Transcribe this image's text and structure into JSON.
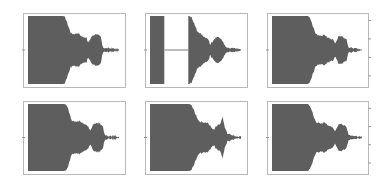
{
  "chart_data": [
    {
      "type": "area",
      "title": "",
      "xlabel": "",
      "ylabel": "",
      "xlim": [
        0,
        1
      ],
      "ylim": [
        -1,
        1
      ],
      "grid": false,
      "envelope": {
        "x": [
          0,
          0.39,
          0.41,
          0.47,
          0.5,
          0.55,
          0.6,
          0.64,
          0.66,
          0.7,
          0.75,
          0.8,
          0.82,
          0.86,
          0.92,
          1.0
        ],
        "amp": [
          1,
          1,
          0.95,
          0.5,
          0.47,
          0.5,
          0.38,
          0.38,
          0.2,
          0.4,
          0.48,
          0.38,
          0.08,
          0.05,
          0.05,
          0.02
        ]
      },
      "silent_gap": null
    },
    {
      "type": "area",
      "title": "",
      "xlabel": "",
      "ylabel": "",
      "xlim": [
        0,
        1
      ],
      "ylim": [
        -1,
        1
      ],
      "grid": false,
      "envelope": {
        "x": [
          0,
          0.16,
          0.42,
          0.43,
          0.46,
          0.52,
          0.57,
          0.6,
          0.64,
          0.66,
          0.7,
          0.75,
          0.79,
          0.83,
          0.86,
          0.92,
          1.0
        ],
        "amp": [
          1,
          1,
          1,
          1,
          0.95,
          0.55,
          0.45,
          0.38,
          0.32,
          0.15,
          0.3,
          0.4,
          0.3,
          0.1,
          0.06,
          0.05,
          0.02
        ]
      },
      "silent_gap": [
        0.16,
        0.42
      ]
    },
    {
      "type": "area",
      "title": "",
      "xlabel": "",
      "ylabel": "",
      "xlim": [
        0,
        1
      ],
      "ylim": [
        -1,
        1
      ],
      "grid": false,
      "envelope": {
        "x": [
          0,
          0.4,
          0.42,
          0.49,
          0.54,
          0.58,
          0.63,
          0.68,
          0.7,
          0.74,
          0.78,
          0.83,
          0.85,
          0.9,
          0.95,
          1.0
        ],
        "amp": [
          1,
          1,
          0.95,
          0.45,
          0.42,
          0.45,
          0.35,
          0.3,
          0.18,
          0.4,
          0.4,
          0.3,
          0.08,
          0.05,
          0.04,
          0.02
        ]
      },
      "silent_gap": null
    },
    {
      "type": "area",
      "title": "",
      "xlabel": "",
      "ylabel": "",
      "xlim": [
        0,
        1
      ],
      "ylim": [
        -1,
        1
      ],
      "grid": false,
      "envelope": {
        "x": [
          0,
          0.4,
          0.43,
          0.48,
          0.52,
          0.57,
          0.62,
          0.66,
          0.68,
          0.72,
          0.77,
          0.82,
          0.84,
          0.88,
          0.94,
          1.0
        ],
        "amp": [
          1,
          1,
          0.95,
          0.5,
          0.47,
          0.5,
          0.38,
          0.35,
          0.2,
          0.4,
          0.45,
          0.35,
          0.08,
          0.05,
          0.05,
          0.02
        ]
      },
      "silent_gap": null
    },
    {
      "type": "area",
      "title": "",
      "xlabel": "",
      "ylabel": "",
      "xlim": [
        0,
        1
      ],
      "ylim": [
        -1,
        1
      ],
      "grid": false,
      "envelope": {
        "x": [
          0,
          0.43,
          0.46,
          0.53,
          0.58,
          0.63,
          0.68,
          0.7,
          0.73,
          0.77,
          0.8,
          0.82,
          0.85,
          0.88,
          0.94,
          1.0
        ],
        "amp": [
          1,
          1,
          0.95,
          0.5,
          0.45,
          0.45,
          0.3,
          0.22,
          0.35,
          0.4,
          0.62,
          0.3,
          0.12,
          0.1,
          0.04,
          0.02
        ]
      },
      "silent_gap": null
    },
    {
      "type": "area",
      "title": "",
      "xlabel": "",
      "ylabel": "",
      "xlim": [
        0,
        1
      ],
      "ylim": [
        -1,
        1
      ],
      "grid": false,
      "envelope": {
        "x": [
          0,
          0.4,
          0.42,
          0.49,
          0.54,
          0.58,
          0.63,
          0.68,
          0.7,
          0.74,
          0.78,
          0.83,
          0.85,
          0.9,
          0.95,
          1.0
        ],
        "amp": [
          1,
          1,
          0.95,
          0.45,
          0.42,
          0.45,
          0.35,
          0.3,
          0.18,
          0.4,
          0.4,
          0.3,
          0.08,
          0.05,
          0.04,
          0.02
        ]
      },
      "silent_gap": null
    }
  ]
}
